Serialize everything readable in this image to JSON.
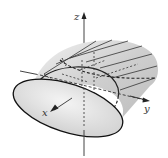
{
  "diagram": {
    "type": "3d-surface-sketch",
    "axes": {
      "x_label": "x",
      "y_label": "y",
      "z_label": "z"
    },
    "colors": {
      "surface_fill": "#d9d9d9",
      "front_face_fill": "#e6e6e6",
      "stroke": "#222222",
      "axis": "#444444"
    }
  }
}
